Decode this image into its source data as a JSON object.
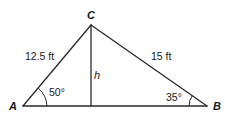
{
  "diagram": {
    "type": "triangle",
    "colors": {
      "line": "#2a2a2a",
      "text": "#1a1a1a",
      "background": "#ffffff"
    },
    "vertices": {
      "A": {
        "label": "A",
        "x": 23,
        "y": 106
      },
      "B": {
        "label": "B",
        "x": 207,
        "y": 106
      },
      "C": {
        "label": "C",
        "x": 91,
        "y": 25
      }
    },
    "sides": {
      "AC": {
        "label": "12.5 ft"
      },
      "BC": {
        "label": "15 ft"
      }
    },
    "angles": {
      "A": {
        "label": "50°"
      },
      "B": {
        "label": "35°"
      }
    },
    "altitude": {
      "label": "h",
      "from": "C",
      "foot_x": 91,
      "foot_y": 106
    }
  }
}
